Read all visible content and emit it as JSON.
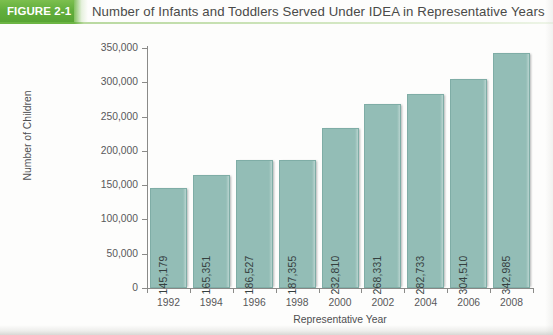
{
  "header": {
    "figure_tag": "FIGURE 2-1",
    "title": "Number of Infants and Toddlers Served Under IDEA in Representative Years",
    "tag_color": "#62ae3c",
    "rule_color": "#6cb544"
  },
  "chart_data": {
    "type": "bar",
    "title": "Number of Infants and Toddlers Served Under IDEA in Representative Years",
    "xlabel": "Representative Year",
    "ylabel": "Number of Children",
    "categories": [
      "1992",
      "1994",
      "1996",
      "1998",
      "2000",
      "2002",
      "2004",
      "2006",
      "2008"
    ],
    "values": [
      145179,
      165351,
      186527,
      187355,
      232810,
      268331,
      282733,
      304510,
      342985
    ],
    "value_labels": [
      "145,179",
      "165,351",
      "186,527",
      "187,355",
      "232,810",
      "268,331",
      "282,733",
      "304,510",
      "342,985"
    ],
    "ylim": [
      0,
      350000
    ],
    "ytick_values": [
      0,
      50000,
      100000,
      150000,
      200000,
      250000,
      300000,
      350000
    ],
    "ytick_labels": [
      "0",
      "50,000",
      "100,000",
      "150,000",
      "200,000",
      "250,000",
      "300,000",
      "350,000"
    ],
    "grid": false,
    "legend": null,
    "bar_color": "#93bdb6",
    "bar_edge_color": "#7fada6"
  }
}
